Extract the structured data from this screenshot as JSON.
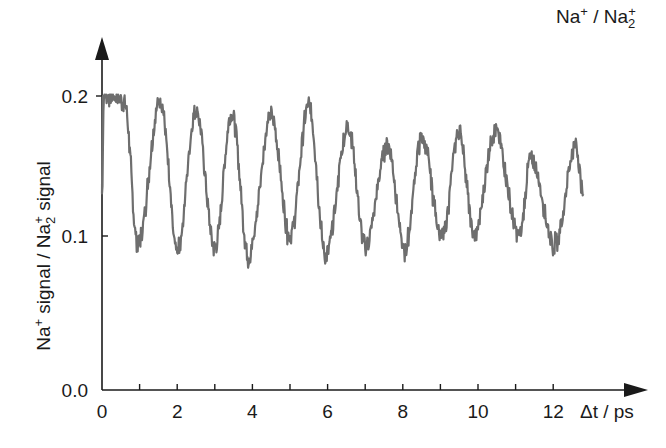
{
  "chart_data": {
    "type": "line",
    "title": "Na+ / Na2+",
    "title_display": {
      "main1": "Na",
      "sup1": "+",
      "sep": " / ",
      "main2": "Na",
      "sub2": "2",
      "sup2": "+"
    },
    "xlabel": "Δt / ps",
    "ylabel": "Na+ signal / Na2+ signal",
    "ylabel_display": {
      "p1": "Na",
      "sup1": "+",
      "p2": " signal / Na",
      "sub2": "2",
      "sup2": "+",
      "p3": " signal"
    },
    "xlim": [
      0,
      12.8
    ],
    "ylim": [
      0.0,
      0.2
    ],
    "x_ticks": [
      0,
      1,
      2,
      3,
      4,
      5,
      6,
      7,
      8,
      9,
      10,
      11,
      12
    ],
    "x_tick_labels": [
      "0",
      "",
      "2",
      "",
      "4",
      "",
      "6",
      "",
      "8",
      "",
      "10",
      "",
      "12"
    ],
    "y_ticks": [
      0.0,
      0.1,
      0.2
    ],
    "y_tick_labels": [
      "0.0",
      "0.1",
      "0.2"
    ],
    "grid": false,
    "legend": "none",
    "series": [
      {
        "name": "Na+ / Na2+ ratio",
        "color": "#6e6e6e",
        "description": "Noisy damped oscillation, period ~1 ps, centered ~0.145, amplitude decaying from ~0.055 to ~0.03",
        "x": [
          0.0,
          0.05,
          0.15,
          0.4,
          0.6,
          0.95,
          1.55,
          2.0,
          2.5,
          3.0,
          3.45,
          3.9,
          4.5,
          5.0,
          5.5,
          5.95,
          6.55,
          7.0,
          7.6,
          8.05,
          8.5,
          9.05,
          9.5,
          9.9,
          10.45,
          11.1,
          11.4,
          12.05,
          12.6,
          12.8
        ],
        "values": [
          0.13,
          0.2,
          0.2,
          0.2,
          0.195,
          0.094,
          0.197,
          0.09,
          0.19,
          0.092,
          0.188,
          0.087,
          0.186,
          0.1,
          0.193,
          0.087,
          0.178,
          0.093,
          0.165,
          0.09,
          0.17,
          0.1,
          0.175,
          0.1,
          0.175,
          0.1,
          0.155,
          0.094,
          0.165,
          0.13
        ]
      }
    ],
    "annotations": [
      {
        "text": "Na+ / Na2+",
        "position": "top-right"
      }
    ]
  }
}
